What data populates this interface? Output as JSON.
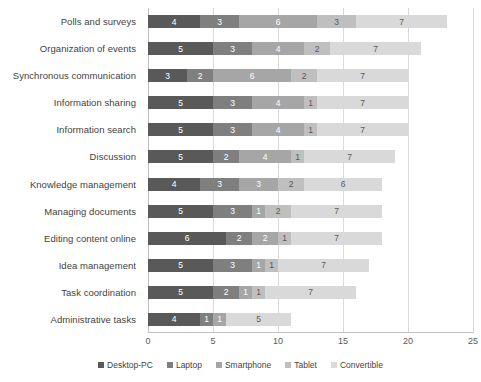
{
  "chart_data": {
    "type": "bar",
    "orientation": "horizontal",
    "stacked": true,
    "title": "",
    "subtitle": "",
    "xlabel": "",
    "ylabel": "",
    "xlim": [
      0,
      25
    ],
    "xticks": [
      0,
      5,
      10,
      15,
      20,
      25
    ],
    "xtick_labels": [
      "0",
      "5",
      "10",
      "15",
      "20",
      "25"
    ],
    "grid": true,
    "grid_axis": "x",
    "legend_position": "bottom",
    "categories": [
      "Polls and surveys",
      "Organization of events",
      "Synchronous communication",
      "Information sharing",
      "Information search",
      "Discussion",
      "Knowledge management",
      "Managing documents",
      "Editing content online",
      "Idea management",
      "Task coordination",
      "Administrative tasks"
    ],
    "series": [
      {
        "name": "Desktop-PC",
        "color": "#595959",
        "values": [
          4,
          5,
          3,
          5,
          5,
          5,
          4,
          5,
          6,
          5,
          5,
          4
        ]
      },
      {
        "name": "Laptop",
        "color": "#7f7f7f",
        "values": [
          3,
          3,
          2,
          3,
          3,
          2,
          3,
          3,
          2,
          3,
          2,
          1
        ]
      },
      {
        "name": "Smartphone",
        "color": "#a6a6a6",
        "values": [
          6,
          4,
          6,
          4,
          4,
          4,
          3,
          1,
          2,
          1,
          1,
          1
        ]
      },
      {
        "name": "Tablet",
        "color": "#bfbfbf",
        "values": [
          3,
          2,
          2,
          1,
          1,
          1,
          2,
          2,
          1,
          1,
          1,
          0
        ]
      },
      {
        "name": "Convertible",
        "color": "#d9d9d9",
        "values": [
          7,
          7,
          7,
          7,
          7,
          7,
          6,
          7,
          7,
          7,
          7,
          5
        ]
      }
    ],
    "totals": [
      23,
      21,
      20,
      20,
      20,
      19,
      18,
      18,
      18,
      17,
      16,
      11
    ]
  },
  "legend": {
    "items": [
      {
        "label": "Desktop-PC",
        "color": "#595959"
      },
      {
        "label": "Laptop",
        "color": "#7f7f7f"
      },
      {
        "label": "Smartphone",
        "color": "#a6a6a6"
      },
      {
        "label": "Tablet",
        "color": "#bfbfbf"
      },
      {
        "label": "Convertible",
        "color": "#d9d9d9"
      }
    ]
  }
}
